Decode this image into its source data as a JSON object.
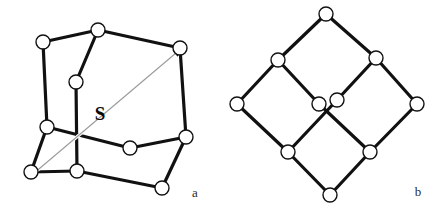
{
  "figure": {
    "background_color": "#ffffff",
    "edge_color": "#111111",
    "node_fill": "#ffffff",
    "node_stroke": "#111111",
    "arrow_color": "#9a9a9a",
    "caption_color": "#2b2b2b",
    "label_color": "#0a0a0a",
    "node_radius": 7,
    "edge_width": 3.2,
    "node_stroke_width": 1.4
  },
  "panels": [
    {
      "id": "panel-a",
      "caption": "a",
      "caption_x": 195,
      "caption_y": 197,
      "description": "cube-like graph in oblique perspective with symmetry axis",
      "nodes": [
        {
          "id": "a1",
          "x": 43,
          "y": 42,
          "label": ""
        },
        {
          "id": "a2",
          "x": 98,
          "y": 30,
          "label": ""
        },
        {
          "id": "a3",
          "x": 180,
          "y": 48,
          "label": ""
        },
        {
          "id": "a4",
          "x": 76,
          "y": 82,
          "label": ""
        },
        {
          "id": "a5",
          "x": 47,
          "y": 127,
          "label": ""
        },
        {
          "id": "a6",
          "x": 186,
          "y": 137,
          "label": ""
        },
        {
          "id": "a7",
          "x": 130,
          "y": 148,
          "label": ""
        },
        {
          "id": "a8",
          "x": 31,
          "y": 172,
          "label": ""
        },
        {
          "id": "a9",
          "x": 77,
          "y": 171,
          "label": ""
        },
        {
          "id": "a10",
          "x": 162,
          "y": 188,
          "label": ""
        }
      ],
      "edges": [
        {
          "from": "a1",
          "to": "a2"
        },
        {
          "from": "a1",
          "to": "a5"
        },
        {
          "from": "a2",
          "to": "a3"
        },
        {
          "from": "a2",
          "to": "a4"
        },
        {
          "from": "a3",
          "to": "a6"
        },
        {
          "from": "a4",
          "to": "a9"
        },
        {
          "from": "a5",
          "to": "a7"
        },
        {
          "from": "a5",
          "to": "a8"
        },
        {
          "from": "a6",
          "to": "a7"
        },
        {
          "from": "a6",
          "to": "a10"
        },
        {
          "from": "a8",
          "to": "a9"
        },
        {
          "from": "a9",
          "to": "a10"
        }
      ],
      "axis_arrow": {
        "label": "S",
        "label_x": 100,
        "label_y": 120,
        "x1": 33,
        "y1": 174,
        "x2": 176,
        "y2": 53,
        "double_headed": true
      }
    },
    {
      "id": "panel-b",
      "caption": "b",
      "caption_x": 418,
      "caption_y": 196,
      "description": "same graph redrawn with symmetric diamond lattice layout",
      "nodes": [
        {
          "id": "b1",
          "x": 326,
          "y": 14,
          "label": ""
        },
        {
          "id": "b2",
          "x": 278,
          "y": 60,
          "label": ""
        },
        {
          "id": "b3",
          "x": 376,
          "y": 58,
          "label": ""
        },
        {
          "id": "b4",
          "x": 237,
          "y": 104,
          "label": ""
        },
        {
          "id": "b5",
          "x": 319,
          "y": 104,
          "label": ""
        },
        {
          "id": "b6",
          "x": 337,
          "y": 100,
          "label": ""
        },
        {
          "id": "b7",
          "x": 417,
          "y": 104,
          "label": ""
        },
        {
          "id": "b8",
          "x": 288,
          "y": 152,
          "label": ""
        },
        {
          "id": "b9",
          "x": 370,
          "y": 152,
          "label": ""
        },
        {
          "id": "b10",
          "x": 330,
          "y": 195,
          "label": ""
        }
      ],
      "edges": [
        {
          "from": "b1",
          "to": "b2"
        },
        {
          "from": "b1",
          "to": "b3"
        },
        {
          "from": "b2",
          "to": "b4"
        },
        {
          "from": "b2",
          "to": "b5"
        },
        {
          "from": "b3",
          "to": "b6"
        },
        {
          "from": "b3",
          "to": "b7"
        },
        {
          "from": "b4",
          "to": "b8"
        },
        {
          "from": "b5",
          "to": "b9"
        },
        {
          "from": "b6",
          "to": "b8"
        },
        {
          "from": "b7",
          "to": "b9"
        },
        {
          "from": "b8",
          "to": "b10"
        },
        {
          "from": "b9",
          "to": "b10"
        }
      ]
    }
  ]
}
